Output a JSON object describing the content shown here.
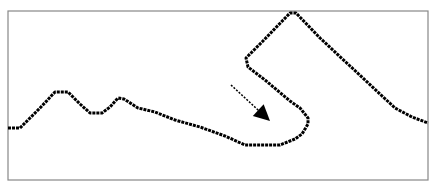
{
  "figure": {
    "caption_fragment": "",
    "frame": {
      "x": 8,
      "y": 11,
      "width": 420,
      "height": 169,
      "stroke": "#888888"
    },
    "curve": {
      "color": "#000000",
      "points": [
        [
          8,
          128
        ],
        [
          20,
          128
        ],
        [
          40,
          108
        ],
        [
          55,
          92
        ],
        [
          68,
          92
        ],
        [
          80,
          104
        ],
        [
          90,
          113
        ],
        [
          102,
          113
        ],
        [
          110,
          107
        ],
        [
          118,
          98
        ],
        [
          124,
          99
        ],
        [
          138,
          108
        ],
        [
          155,
          112
        ],
        [
          175,
          120
        ],
        [
          200,
          127
        ],
        [
          225,
          136
        ],
        [
          245,
          145
        ],
        [
          280,
          145
        ],
        [
          295,
          139
        ],
        [
          302,
          134
        ],
        [
          308,
          124
        ],
        [
          308,
          118
        ],
        [
          300,
          108
        ],
        [
          290,
          101
        ],
        [
          265,
          80
        ],
        [
          248,
          67
        ],
        [
          246,
          58
        ],
        [
          262,
          42
        ],
        [
          290,
          13
        ],
        [
          296,
          13
        ],
        [
          320,
          38
        ],
        [
          350,
          66
        ],
        [
          380,
          94
        ],
        [
          395,
          108
        ],
        [
          412,
          117
        ],
        [
          428,
          123
        ]
      ]
    },
    "arrow": {
      "from": [
        231,
        85
      ],
      "to": [
        270,
        121
      ],
      "color": "#000000"
    }
  }
}
